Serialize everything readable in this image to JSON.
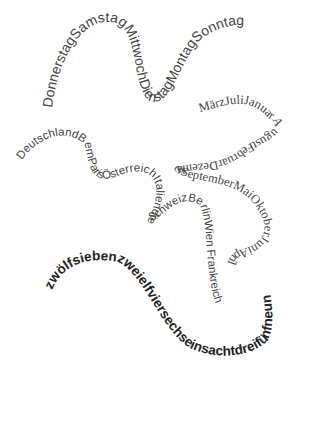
{
  "canvas": {
    "width": 310,
    "height": 424,
    "background": "#ffffff"
  },
  "paths": {
    "weekdays": {
      "text": "DonnerstagSamstagMittwochDienstagMontagSonntag",
      "color": "#444444"
    },
    "places": {
      "text": "DeutschlandBernParisÖsterreichItaliendieSchweizBerlinWien Frankreich",
      "color": "#444444"
    },
    "months": {
      "text": "MärzJuliJanuarAugustFebruarDezemberSeptemberMaiOktoberJuniApril",
      "color": "#444444"
    },
    "numbers": {
      "text": "zwölfsiebenzweielfviersechseinsachtdreifünfneun",
      "color": "#222222"
    }
  }
}
